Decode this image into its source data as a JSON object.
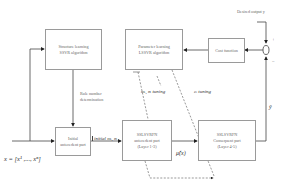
{
  "diagram": {
    "blocks": {
      "structure_learning": {
        "line1": "Structure learning",
        "line2": "SSVR algorithm"
      },
      "parameter_learning": {
        "line1": "Parameter learning",
        "line2": "LSSVR algorithm"
      },
      "cost_function": {
        "label": "Cost function"
      },
      "initial_antecedent": {
        "line1": "Initial",
        "line2": "antecedent part"
      },
      "antecedent": {
        "line1": "SSLSVRFN",
        "line2": "antecedent part",
        "line3": "(Layer 1-3)"
      },
      "consequent": {
        "line1": "SSLSVRFN",
        "line2": "Consequent part",
        "line3": "(Layer 4-5)"
      }
    },
    "labels": {
      "desired_output": "Desired output  y",
      "rule_number_1": "Rule number",
      "rule_number_2": "determination",
      "input": "x = [x¹ ,..., xⁿ]",
      "initial_params": "initial mᵢ, σᵢ",
      "antecedent_tuning": "mᵢ, σᵢ  tuning",
      "consequent_tuning": "cᵢ  tuning",
      "mu": "μ̂(x)",
      "output": "ŷ",
      "plus": "+",
      "minus": "−"
    }
  }
}
